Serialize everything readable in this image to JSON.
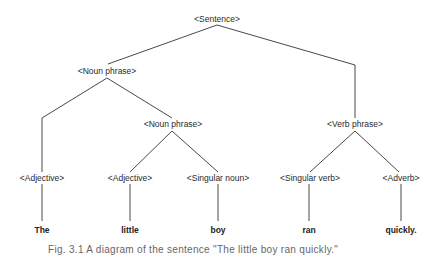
{
  "diagram": {
    "type": "parse-tree",
    "nodes": {
      "sentence": {
        "label": "<Sentence>",
        "x": 217,
        "y": 19
      },
      "noun_phrase_1": {
        "label": "<Noun phrase>",
        "x": 107,
        "y": 71
      },
      "noun_phrase_2": {
        "label": "<Noun phrase>",
        "x": 173,
        "y": 124
      },
      "verb_phrase": {
        "label": "<Verb phrase>",
        "x": 355,
        "y": 124
      },
      "adjective_1": {
        "label": "<Adjective>",
        "x": 42,
        "y": 178
      },
      "adjective_2": {
        "label": "<Adjective>",
        "x": 130,
        "y": 178
      },
      "singular_noun": {
        "label": "<Singular noun>",
        "x": 218,
        "y": 178
      },
      "singular_verb": {
        "label": "<Singular verb>",
        "x": 310,
        "y": 178
      },
      "adverb": {
        "label": "<Adverb>",
        "x": 401,
        "y": 178
      }
    },
    "words": {
      "the": {
        "label": "The",
        "x": 42,
        "y": 230
      },
      "little": {
        "label": "little",
        "x": 130,
        "y": 230
      },
      "boy": {
        "label": "boy",
        "x": 218,
        "y": 230
      },
      "ran": {
        "label": "ran",
        "x": 309,
        "y": 230
      },
      "quickly": {
        "label": "quickly.",
        "x": 401,
        "y": 230
      }
    },
    "edges": [
      [
        "sentence",
        "noun_phrase_1"
      ],
      [
        "sentence",
        "verb_phrase"
      ],
      [
        "noun_phrase_1",
        "adjective_1"
      ],
      [
        "noun_phrase_1",
        "noun_phrase_2"
      ],
      [
        "noun_phrase_2",
        "adjective_2"
      ],
      [
        "noun_phrase_2",
        "singular_noun"
      ],
      [
        "verb_phrase",
        "singular_verb"
      ],
      [
        "verb_phrase",
        "adverb"
      ],
      [
        "adjective_1",
        "the"
      ],
      [
        "adjective_2",
        "little"
      ],
      [
        "singular_noun",
        "boy"
      ],
      [
        "singular_verb",
        "ran"
      ],
      [
        "adverb",
        "quickly"
      ]
    ],
    "caption": "Fig. 3.1   A diagram of the sentence \"The little boy ran quickly.\""
  }
}
